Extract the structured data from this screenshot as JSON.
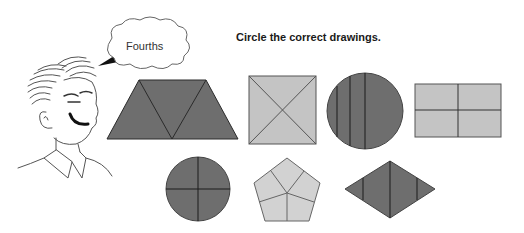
{
  "worksheet": {
    "instruction": "Circle the correct drawings.",
    "speech_bubble": "Fourths",
    "character": "cartoon-boy",
    "colors": {
      "dark_fill": "#6e6e6e",
      "light_fill": "#c4c4c4",
      "stroke": "#2a2a2a",
      "line_art": "#555555"
    },
    "shapes": [
      {
        "id": "trapezoid",
        "fill": "dark",
        "parts": 3,
        "division": "triangles"
      },
      {
        "id": "square",
        "fill": "light",
        "parts": 4,
        "division": "diagonals"
      },
      {
        "id": "large-circle",
        "fill": "dark",
        "parts": 4,
        "division": "unequal vertical lines"
      },
      {
        "id": "rectangle",
        "fill": "light",
        "parts": 4,
        "division": "cross"
      },
      {
        "id": "small-circle",
        "fill": "dark",
        "parts": 4,
        "division": "cross"
      },
      {
        "id": "pentagon",
        "fill": "light",
        "parts": 5,
        "division": "center to edges"
      },
      {
        "id": "rhombus",
        "fill": "dark",
        "parts": 4,
        "division": "vertical lines"
      }
    ]
  }
}
